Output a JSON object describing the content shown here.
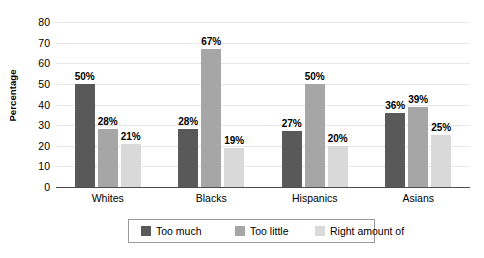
{
  "chart_data": {
    "type": "bar",
    "title": "",
    "xlabel": "",
    "ylabel": "Percentage",
    "ylim": [
      0,
      80
    ],
    "ytick_step": 10,
    "yticks": [
      80,
      70,
      60,
      50,
      40,
      30,
      20,
      10,
      0
    ],
    "grid": true,
    "legend_position": "bottom",
    "value_suffix": "%",
    "categories": [
      "Whites",
      "Blacks",
      "Hispanics",
      "Asians"
    ],
    "series": [
      {
        "name": "Too much",
        "color": "#595959",
        "values": [
          50,
          28,
          27,
          36
        ],
        "labels": [
          "50%",
          "28%",
          "27%",
          "36%"
        ]
      },
      {
        "name": "Too little",
        "color": "#a6a6a6",
        "values": [
          28,
          67,
          50,
          39
        ],
        "labels": [
          "28%",
          "67%",
          "50%",
          "39%"
        ]
      },
      {
        "name": "Right amount of",
        "color": "#d9d9d9",
        "values": [
          21,
          19,
          20,
          25
        ],
        "labels": [
          "21%",
          "19%",
          "20%",
          "25%"
        ]
      }
    ]
  },
  "axis": {
    "y_title": "Percentage",
    "tick_labels": [
      "80",
      "70",
      "60",
      "50",
      "40",
      "30",
      "20",
      "10",
      "0"
    ],
    "category_labels": [
      "Whites",
      "Blacks",
      "Hispanics",
      "Asians"
    ]
  },
  "legend": {
    "items": [
      {
        "label": "Too much",
        "color": "#595959"
      },
      {
        "label": "Too little",
        "color": "#a6a6a6"
      },
      {
        "label": "Right amount of",
        "color": "#d9d9d9"
      }
    ]
  },
  "colors": {
    "too_much": "#595959",
    "too_little": "#a6a6a6",
    "right_amount": "#d9d9d9",
    "gridline": "#e8e8e8",
    "axis": "#4d4d4d",
    "background": "#ffffff"
  }
}
